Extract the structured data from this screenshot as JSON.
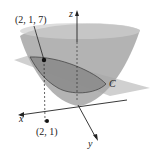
{
  "diagram": {
    "labels": {
      "point_3d": "(2, 1, 7)",
      "point_2d": "(2, 1)",
      "curve": "C",
      "x_axis": "x",
      "y_axis": "y",
      "z_axis": "z"
    },
    "colors": {
      "surface": "#a9a9a9",
      "surface_dark": "#7d7d7d",
      "plane": "#bdbdbd",
      "axis": "#222222"
    }
  }
}
